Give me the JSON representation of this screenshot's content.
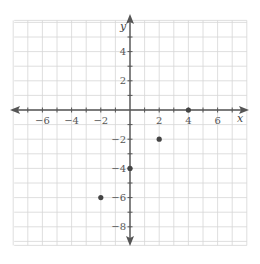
{
  "chart_data": {
    "type": "scatter",
    "title": "",
    "xlabel": "x",
    "ylabel": "y",
    "xlim": [
      -8,
      8
    ],
    "ylim": [
      -9,
      6
    ],
    "grid": true,
    "x_ticks": [
      -6,
      -4,
      -2,
      2,
      4,
      6
    ],
    "y_ticks": [
      4,
      2,
      -2,
      -4,
      -6,
      -8
    ],
    "x_tick_labels": [
      "−6",
      "−4",
      "−2",
      "2",
      "4",
      "6"
    ],
    "y_tick_labels": [
      "4",
      "2",
      "−2",
      "−4",
      "−6",
      "−8"
    ],
    "points": [
      {
        "x": 4,
        "y": 0
      },
      {
        "x": 2,
        "y": -2
      },
      {
        "x": 0,
        "y": -4
      },
      {
        "x": -2,
        "y": -6
      }
    ],
    "colors": {
      "grid": "#d6d6d6",
      "axis": "#555555",
      "point": "#444444",
      "text": "#555555"
    }
  }
}
